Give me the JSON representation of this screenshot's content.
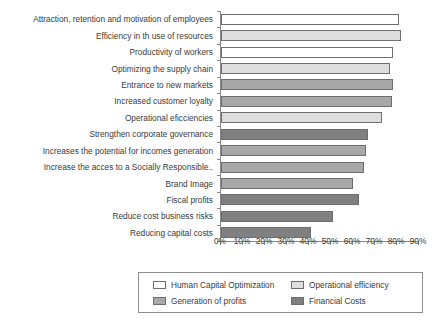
{
  "chart_data": {
    "type": "bar",
    "orientation": "horizontal",
    "title": "",
    "xlabel": "",
    "ylabel": "",
    "xlim": [
      0,
      90
    ],
    "xtick_labels": [
      "0%",
      "10%",
      "20%",
      "30%",
      "40%",
      "50%",
      "60%",
      "70%",
      "80%",
      "90%"
    ],
    "xtick_values": [
      0,
      10,
      20,
      30,
      40,
      50,
      60,
      70,
      80,
      90
    ],
    "grid": false,
    "legend_position": "bottom",
    "categories": [
      "Attraction, retention and motivation of employees",
      "Efficiency in th use of resources",
      "Productivity of workers",
      "Optimizing the supply chain",
      "Entrance to new markets",
      "Increased customer loyalty",
      "Operational eficciencies",
      "Strengthen corporate governance",
      "Increases the potential for incomes generation",
      "Increase the acces to a Socially Responsible..",
      "Brand Image",
      "Fiscal profits",
      "Reduce cost business risks",
      "Reducing capital costs"
    ],
    "values": [
      81,
      82,
      78,
      77,
      78,
      77.5,
      73,
      67,
      66,
      65,
      60,
      62.5,
      51,
      41
    ],
    "group_of_bar": [
      "Human Capital Optimization",
      "Operational efficiency",
      "Human Capital Optimization",
      "Operational efficiency",
      "Generation of profits",
      "Generation of profits",
      "Operational efficiency",
      "Financial Costs",
      "Generation of profits",
      "Generation of profits",
      "Generation of profits",
      "Financial Costs",
      "Financial Costs",
      "Financial Costs"
    ],
    "legend": [
      {
        "label": "Human Capital Optimization",
        "color": "#ffffff"
      },
      {
        "label": "Operational efficiency",
        "color": "#dedede"
      },
      {
        "label": "Generation of profits",
        "color": "#a8a8a8"
      },
      {
        "label": "Financial Costs",
        "color": "#808080"
      }
    ],
    "series_colors": {
      "Human Capital Optimization": "#ffffff",
      "Operational efficiency": "#dedede",
      "Generation of profits": "#a8a8a8",
      "Financial Costs": "#808080"
    },
    "bar_edge_color": "#6e6e6e",
    "axis_color": "#8a8a8a",
    "text_color": "#3a3a3a"
  }
}
